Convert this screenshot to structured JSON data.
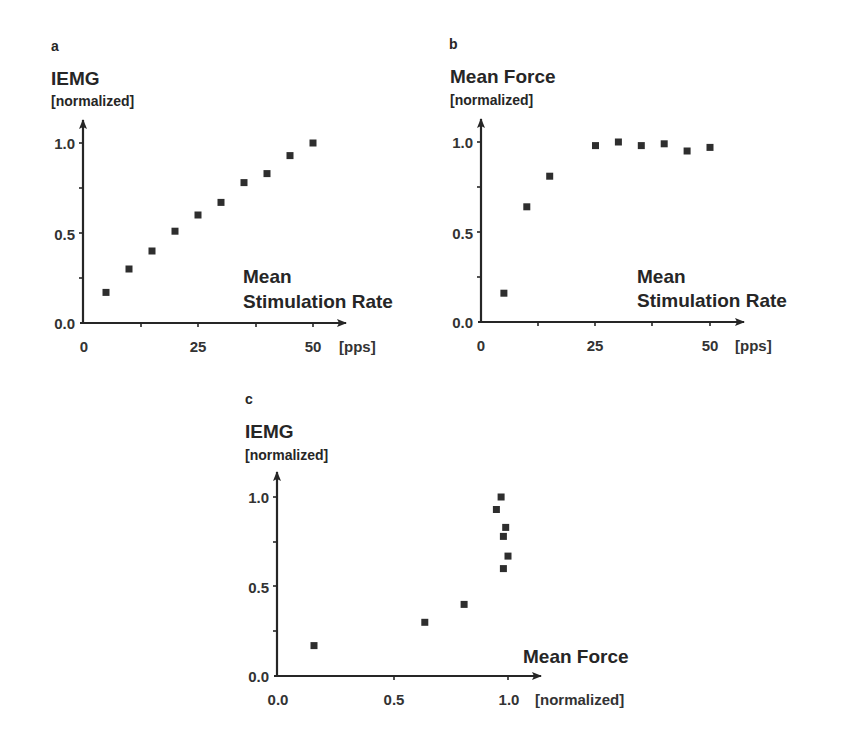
{
  "colors": {
    "ink": "#262626",
    "marker": "#2e2e2e",
    "background": "#ffffff"
  },
  "chart_data": [
    {
      "id": "a",
      "type": "scatter",
      "panel_label": "a",
      "title": "",
      "ylabel": "IEMG",
      "ylabel_unit": "[normalized]",
      "xlabel_line1": "Mean",
      "xlabel_line2": "Stimulation Rate",
      "xlabel_unit": "[pps]",
      "xlim": [
        0,
        55
      ],
      "ylim": [
        0,
        1.15
      ],
      "xticks": [
        0,
        25,
        50
      ],
      "xticks_minor": [
        12.5,
        37.5
      ],
      "xtick_labels": [
        "0",
        "25",
        "50"
      ],
      "yticks": [
        0.0,
        0.5,
        1.0
      ],
      "yticks_minor": [
        0.25,
        0.75
      ],
      "ytick_labels": [
        "0.0",
        "0.5",
        "1.0"
      ],
      "grid": false,
      "marker": "square",
      "x": [
        5,
        10,
        15,
        20,
        25,
        30,
        35,
        40,
        45,
        50
      ],
      "y": [
        0.17,
        0.3,
        0.4,
        0.51,
        0.6,
        0.67,
        0.78,
        0.83,
        0.93,
        1.0
      ]
    },
    {
      "id": "b",
      "type": "scatter",
      "panel_label": "b",
      "title": "",
      "ylabel": "Mean Force",
      "ylabel_unit": "[normalized]",
      "xlabel_line1": "Mean",
      "xlabel_line2": "Stimulation Rate",
      "xlabel_unit": "[pps]",
      "xlim": [
        0,
        55
      ],
      "ylim": [
        0,
        1.15
      ],
      "xticks": [
        0,
        25,
        50
      ],
      "xticks_minor": [
        12.5,
        37.5
      ],
      "xtick_labels": [
        "0",
        "25",
        "50"
      ],
      "yticks": [
        0.0,
        0.5,
        1.0
      ],
      "yticks_minor": [
        0.25,
        0.75
      ],
      "ytick_labels": [
        "0.0",
        "0.5",
        "1.0"
      ],
      "grid": false,
      "marker": "square",
      "x": [
        5,
        10,
        15,
        25,
        30,
        35,
        40,
        45,
        50
      ],
      "y": [
        0.16,
        0.64,
        0.81,
        0.98,
        1.0,
        0.98,
        0.99,
        0.95,
        0.97
      ]
    },
    {
      "id": "c",
      "type": "scatter",
      "panel_label": "c",
      "title": "",
      "ylabel": "IEMG",
      "ylabel_unit": "[normalized]",
      "xlabel_line1": "Mean Force",
      "xlabel_line2": "",
      "xlabel_unit": "[normalized]",
      "xlim": [
        0,
        1.1
      ],
      "ylim": [
        0,
        1.15
      ],
      "xticks": [
        0.0,
        0.5,
        1.0
      ],
      "xticks_minor": [],
      "xtick_labels": [
        "0.0",
        "0.5",
        "1.0"
      ],
      "yticks": [
        0.0,
        0.5,
        1.0
      ],
      "yticks_minor": [
        0.25,
        0.75
      ],
      "ytick_labels": [
        "0.0",
        "0.5",
        "1.0"
      ],
      "grid": false,
      "marker": "square",
      "x": [
        0.16,
        0.64,
        0.81,
        0.98,
        1.0,
        0.98,
        0.99,
        0.95,
        0.97
      ],
      "y": [
        0.17,
        0.3,
        0.4,
        0.6,
        0.67,
        0.78,
        0.83,
        0.93,
        1.0
      ]
    }
  ]
}
